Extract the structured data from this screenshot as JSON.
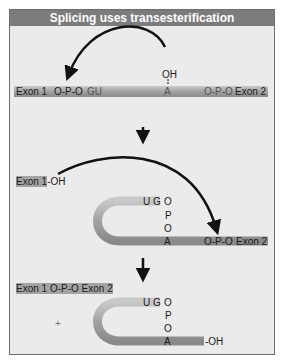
{
  "title": "Splicing uses transesterification",
  "stage1": {
    "exon1": "Exon 1",
    "link1": "O-P-O",
    "gu": "GU",
    "oh": "OH",
    "a": "A",
    "link2": "O-P-O",
    "exon2": "Exon 2"
  },
  "stage2": {
    "exon1": "Exon 1",
    "oh": "-OH",
    "ug": "U G",
    "o1": "O",
    "p": "P",
    "o2": "O",
    "a": "A",
    "link2": "O-P-O",
    "exon2": "Exon 2"
  },
  "stage3": {
    "product": "Exon 1 O-P-O Exon 2",
    "ug": "U G",
    "o1": "O",
    "p": "P",
    "o2": "O",
    "a": "A",
    "oh": "-OH",
    "plus": "+"
  },
  "colors": {
    "title_bg": "#7c7c7c",
    "panel_bg": "#ebebeb",
    "tube": "#a8a8a8",
    "arrow": "#111111"
  }
}
